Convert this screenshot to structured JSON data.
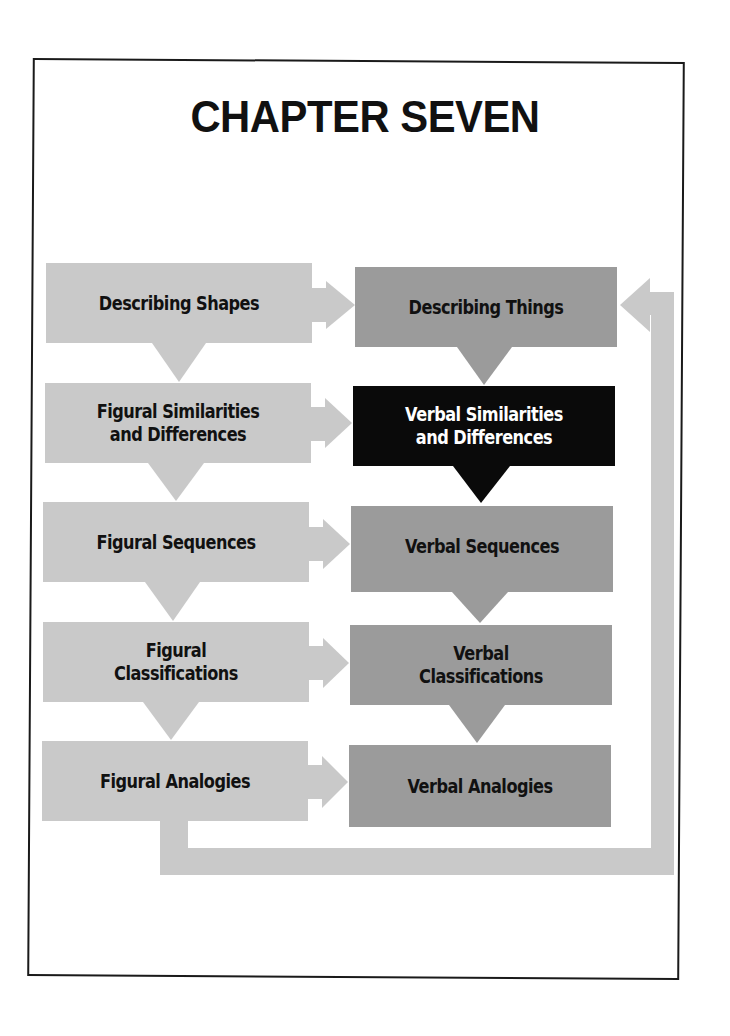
{
  "title": "CHAPTER SEVEN",
  "colors": {
    "figural_box": "#c9c9c9",
    "verbal_box": "#9b9b9b",
    "highlight_box": "#0a0a0a",
    "highlight_text": "#ffffff",
    "loop_arrow": "#c9c9c9",
    "frame": "#1a1a1a"
  },
  "left_column": {
    "items": [
      {
        "label": "Describing Shapes"
      },
      {
        "label": "Figural Similarities\nand Differences"
      },
      {
        "label": "Figural Sequences"
      },
      {
        "label": "Figural\nClassifications"
      },
      {
        "label": "Figural Analogies"
      }
    ]
  },
  "right_column": {
    "items": [
      {
        "label": "Describing Things"
      },
      {
        "label": "Verbal Similarities\nand Differences",
        "highlighted": true
      },
      {
        "label": "Verbal Sequences"
      },
      {
        "label": "Verbal\nClassifications"
      },
      {
        "label": "Verbal Analogies"
      }
    ]
  },
  "connections": [
    {
      "from": "Describing Shapes",
      "to": "Describing Things",
      "direction": "right"
    },
    {
      "from": "Figural Similarities and Differences",
      "to": "Verbal Similarities and Differences",
      "direction": "right"
    },
    {
      "from": "Figural Sequences",
      "to": "Verbal Sequences",
      "direction": "right"
    },
    {
      "from": "Figural Classifications",
      "to": "Verbal Classifications",
      "direction": "right"
    },
    {
      "from": "Figural Analogies",
      "to": "Verbal Analogies",
      "direction": "right"
    },
    {
      "from": "Figural Analogies",
      "to": "Describing Things",
      "direction": "loop-back"
    }
  ]
}
